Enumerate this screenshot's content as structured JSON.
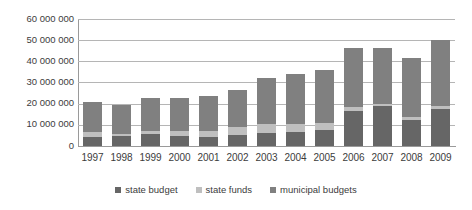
{
  "chart_data": {
    "type": "bar",
    "stacked": true,
    "title": "",
    "xlabel": "",
    "ylabel": "",
    "ylim": [
      0,
      60000000
    ],
    "grid": true,
    "legend_position": "bottom",
    "categories": [
      "1997",
      "1998",
      "1999",
      "2000",
      "2001",
      "2002",
      "2003",
      "2004",
      "2005",
      "2006",
      "2007",
      "2008",
      "2009"
    ],
    "ytick_labels": [
      "60 000 000",
      "50 000 000",
      "40 000 000",
      "30 000 000",
      "20 000 000",
      "10 000 000",
      "0"
    ],
    "ytick_values": [
      60000000,
      50000000,
      40000000,
      30000000,
      20000000,
      10000000,
      0
    ],
    "series": [
      {
        "name": "state budget",
        "color": "#666666",
        "values": [
          4200000,
          4500000,
          5500000,
          4700000,
          4200000,
          5000000,
          6200000,
          6800000,
          7800000,
          16500000,
          19000000,
          12200000,
          17500000
        ]
      },
      {
        "name": "state funds",
        "color": "#bfbfbf",
        "values": [
          2600000,
          1400000,
          1700000,
          2500000,
          3100000,
          3800000,
          4000000,
          3600000,
          3000000,
          1800000,
          1000000,
          1600000,
          1300000
        ]
      },
      {
        "name": "municipal budgets",
        "color": "#808080",
        "values": [
          14000000,
          13600000,
          15600000,
          15600000,
          16300000,
          17500000,
          21800000,
          23800000,
          25200000,
          27900000,
          26500000,
          27700000,
          31200000
        ]
      }
    ],
    "totals": [
      20800000,
      19500000,
      22800000,
      22800000,
      23600000,
      26300000,
      32000000,
      34200000,
      36000000,
      46200000,
      46500000,
      41500000,
      50000000
    ]
  }
}
